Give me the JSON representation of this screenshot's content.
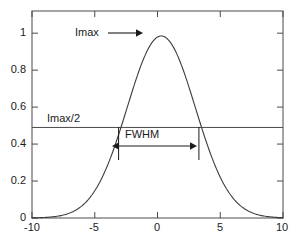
{
  "chart_data": {
    "type": "line",
    "title": "",
    "xlabel": "",
    "ylabel": "",
    "xlim": [
      -10,
      10
    ],
    "ylim": [
      0,
      1.12
    ],
    "grid": false,
    "legend": "none",
    "xticks": [
      "-10",
      "-5",
      "0",
      "5",
      "10"
    ],
    "xtick_values": [
      -10,
      -5,
      0,
      5,
      10
    ],
    "yticks": [
      "0",
      "0.2",
      "0.4",
      "0.6",
      "0.8",
      "1"
    ],
    "ytick_values": [
      0,
      0.2,
      0.4,
      0.6,
      0.8,
      1
    ],
    "series": [
      {
        "name": "intensity",
        "color": "#3c3c3c",
        "peak_x": 0.3,
        "peak_y": 0.985,
        "fwhm": 6.4,
        "x": [
          -10.0,
          -9.5,
          -9.0,
          -8.5,
          -8.0,
          -7.5,
          -7.0,
          -6.5,
          -6.0,
          -5.5,
          -5.0,
          -4.5,
          -4.0,
          -3.5,
          -3.0,
          -2.5,
          -2.0,
          -1.5,
          -1.0,
          -0.5,
          0.0,
          0.3,
          0.5,
          1.0,
          1.5,
          2.0,
          2.5,
          3.0,
          3.5,
          4.0,
          4.5,
          5.0,
          5.5,
          6.0,
          6.5,
          7.0,
          7.5,
          8.0,
          8.5,
          9.0,
          9.5,
          10.0
        ],
        "y": [
          0.002,
          0.003,
          0.005,
          0.008,
          0.013,
          0.021,
          0.033,
          0.051,
          0.078,
          0.115,
          0.165,
          0.231,
          0.313,
          0.409,
          0.515,
          0.624,
          0.726,
          0.816,
          0.889,
          0.946,
          0.977,
          0.985,
          0.982,
          0.958,
          0.907,
          0.833,
          0.74,
          0.636,
          0.528,
          0.424,
          0.33,
          0.249,
          0.183,
          0.131,
          0.092,
          0.063,
          0.042,
          0.028,
          0.018,
          0.011,
          0.007,
          0.004
        ]
      }
    ],
    "reference_lines": [
      {
        "name": "half-max-line",
        "orientation": "horizontal",
        "y": 0.49,
        "label": "Imax/2",
        "color": "#4a4a4a"
      }
    ],
    "annotations": [
      {
        "name": "imax-annotation",
        "label": "Imax",
        "arrow": "right",
        "x_text": -6.1,
        "y_text": 0.985
      },
      {
        "name": "fwhm-annotation",
        "label": "FWHM",
        "arrow": "double",
        "x_left": -3.1,
        "x_right": 3.3,
        "y": 0.39
      }
    ]
  },
  "labels": {
    "imax": "Imax",
    "imax_half": "Imax/2",
    "fwhm": "FWHM"
  },
  "colors": {
    "axis": "#4a4a4a",
    "curve": "#3c3c3c",
    "text": "#1a1a1a",
    "background": "#ffffff"
  }
}
